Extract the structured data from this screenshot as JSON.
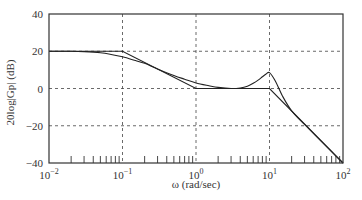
{
  "chart_data": {
    "type": "line",
    "title": "",
    "xlabel": "ω (rad/sec)",
    "ylabel": "20log|Gp| (dB)",
    "xscale": "log",
    "xlim": [
      0.01,
      100
    ],
    "ylim": [
      -40,
      40
    ],
    "x_ticks": [
      {
        "value": 0.01,
        "base": "10",
        "exp": "−2"
      },
      {
        "value": 0.1,
        "base": "10",
        "exp": "−1"
      },
      {
        "value": 1,
        "base": "10",
        "exp": "0"
      },
      {
        "value": 10,
        "base": "10",
        "exp": "1"
      },
      {
        "value": 100,
        "base": "10",
        "exp": "2"
      }
    ],
    "y_ticks": [
      40,
      20,
      0,
      -20,
      -40
    ],
    "y_tick_labels": [
      "40",
      "20",
      "0",
      "−20",
      "−40"
    ],
    "grid": "dashed at major decades and 20 dB steps",
    "legend": null,
    "series": [
      {
        "name": "Asymptotic approximation",
        "x": [
          0.01,
          0.1,
          1,
          10,
          100
        ],
        "y": [
          20,
          20,
          0,
          0,
          -40
        ]
      },
      {
        "name": "Actual magnitude",
        "x": [
          0.01,
          0.02,
          0.03,
          0.05,
          0.07,
          0.1,
          0.15,
          0.2,
          0.3,
          0.5,
          0.7,
          1,
          1.5,
          2,
          3,
          4,
          5,
          6,
          7,
          8,
          9,
          10,
          12,
          15,
          20,
          30,
          50,
          70,
          100
        ],
        "y": [
          20,
          20,
          19.8,
          19.2,
          18.3,
          17,
          15,
          13.5,
          10.5,
          7,
          5,
          3,
          1.5,
          0.6,
          0,
          0.3,
          1.2,
          2.8,
          4.5,
          6.3,
          7.8,
          8.5,
          4,
          -4,
          -12,
          -19.3,
          -28.1,
          -33.9,
          -40
        ]
      }
    ],
    "axis_color": "#333333",
    "line_color": "#222222",
    "grid_color": "#444444"
  }
}
